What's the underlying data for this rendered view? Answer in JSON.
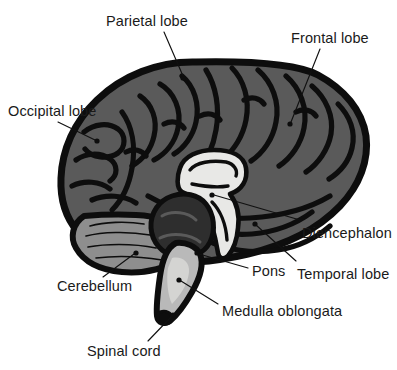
{
  "diagram": {
    "view": "midsagittal-lateral",
    "background_color": "#ffffff",
    "outline_color": "#0d0d0d",
    "palette": {
      "cortex_gray": "#5a5a5a",
      "cerebellum_gray": "#8e8e8e",
      "diencephalon_light": "#e8e8e6",
      "pons_dark": "#2e2e2e",
      "brainstem_light": "#b9b9b9",
      "medulla_light": "#d4d4d2",
      "label_text": "#1a1a1a",
      "leader_line": "#111111"
    },
    "labels": [
      {
        "id": "parietal-lobe",
        "text": "Parietal lobe",
        "text_x": 106,
        "text_y": 14,
        "anchor": "start",
        "leader": [
          [
            164,
            32
          ],
          [
            183,
            76
          ]
        ],
        "dot": [
          183,
          78
        ]
      },
      {
        "id": "frontal-lobe",
        "text": "Frontal lobe",
        "text_x": 291,
        "text_y": 31,
        "anchor": "start",
        "leader": [
          [
            320,
            49
          ],
          [
            291,
            122
          ]
        ],
        "dot": [
          290,
          124
        ]
      },
      {
        "id": "occipital-lobe",
        "text": "Occipital lobe",
        "text_x": 8,
        "text_y": 104,
        "anchor": "start",
        "leader": [
          [
            58,
            122
          ],
          [
            95,
            140
          ]
        ],
        "dot": [
          97,
          141
        ]
      },
      {
        "id": "diencephalon",
        "text": "Diencephalon",
        "text_x": 302,
        "text_y": 226,
        "anchor": "start",
        "leader": [
          [
            300,
            220
          ],
          [
            214,
            195
          ]
        ],
        "dot": [
          212,
          195
        ]
      },
      {
        "id": "temporal-lobe",
        "text": "Temporal lobe",
        "text_x": 297,
        "text_y": 267,
        "anchor": "start",
        "leader": [
          [
            296,
            261
          ],
          [
            256,
            225
          ]
        ],
        "dot": [
          255,
          224
        ]
      },
      {
        "id": "pons",
        "text": "Pons",
        "text_x": 252,
        "text_y": 264,
        "anchor": "start",
        "leader": [
          [
            248,
            268
          ],
          [
            199,
            254
          ]
        ],
        "dot": [
          197,
          253
        ]
      },
      {
        "id": "cerebellum",
        "text": "Cerebellum",
        "text_x": 57,
        "text_y": 279,
        "anchor": "start",
        "leader": [
          [
            103,
            277
          ],
          [
            134,
            254
          ]
        ],
        "dot": [
          136,
          253
        ]
      },
      {
        "id": "medulla-oblongata",
        "text": "Medulla oblongata",
        "text_x": 222,
        "text_y": 304,
        "anchor": "start",
        "leader": [
          [
            218,
            304
          ],
          [
            181,
            281
          ]
        ],
        "dot": [
          179,
          280
        ]
      },
      {
        "id": "spinal-cord",
        "text": "Spinal cord",
        "text_x": 87,
        "text_y": 344,
        "anchor": "start",
        "leader": [
          [
            148,
            341
          ],
          [
            172,
            316
          ]
        ],
        "dot": [
          173,
          315
        ]
      }
    ]
  }
}
